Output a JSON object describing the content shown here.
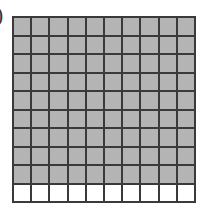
{
  "label": ")",
  "grid": {
    "rows": 10,
    "columns": 10,
    "shaded_cells": 90,
    "total_cells": 100,
    "shaded_color": "#b4b4b4",
    "unshaded_color": "#ffffff",
    "line_color": "#3a3a3a"
  }
}
